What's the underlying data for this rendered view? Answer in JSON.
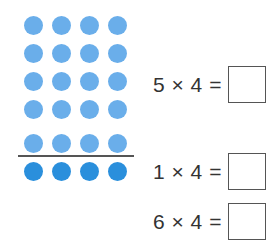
{
  "dot_array": {
    "columns": 4,
    "rows_above_line": 5,
    "rows_below_line": 1,
    "colors": {
      "light": "#6aaeea",
      "dark": "#2a8fdc"
    },
    "divider_color": "#555555"
  },
  "equations": [
    {
      "text": "5 × 4 =",
      "answer": ""
    },
    {
      "text": "1 × 4 =",
      "answer": ""
    },
    {
      "text": "6 × 4 =",
      "answer": ""
    }
  ]
}
